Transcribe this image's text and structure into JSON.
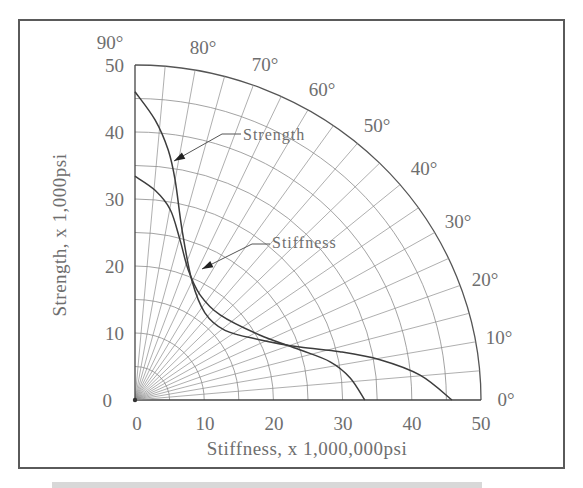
{
  "chart_data": {
    "type": "line",
    "subtype": "polar-quadrant (Hankinson-style) overlay on cartesian axes",
    "title": "",
    "xlabel": "Stiffness, x 1,000,000psi",
    "ylabel": "Strength, x 1,000psi",
    "xlim": [
      0,
      50
    ],
    "ylim": [
      0,
      50
    ],
    "x_ticks": [
      "0",
      "10",
      "20",
      "30",
      "40",
      "50"
    ],
    "y_ticks": [
      "0",
      "10",
      "20",
      "30",
      "40",
      "50"
    ],
    "angle_ticks": [
      "0°",
      "10°",
      "20°",
      "30°",
      "40°",
      "50°",
      "60°",
      "70°",
      "80°",
      "90°"
    ],
    "grid": {
      "radial_lines_every_deg": 5,
      "arcs_every_units": 5,
      "outer_radius": 50
    },
    "legend": null,
    "annotations": [
      {
        "text": "Strength",
        "points_to_series": "Strength"
      },
      {
        "text": "Stiffness",
        "points_to_series": "Stiffness"
      }
    ],
    "series": [
      {
        "name": "Strength",
        "points": [
          [
            0,
            46
          ],
          [
            2.9,
            41.8
          ],
          [
            4.8,
            37.3
          ],
          [
            5.8,
            32.8
          ],
          [
            6.8,
            25.4
          ],
          [
            8.2,
            17.9
          ],
          [
            10.1,
            13
          ],
          [
            13,
            10.4
          ],
          [
            18,
            9
          ],
          [
            23.8,
            7.9
          ],
          [
            29.6,
            7.2
          ],
          [
            35.4,
            6
          ],
          [
            41.2,
            3.7
          ],
          [
            45.8,
            0
          ]
        ]
      },
      {
        "name": "Stiffness",
        "points": [
          [
            0,
            33.4
          ],
          [
            2.9,
            31.3
          ],
          [
            5.1,
            28.4
          ],
          [
            6.5,
            23.9
          ],
          [
            7.7,
            19.4
          ],
          [
            9.4,
            15.7
          ],
          [
            12.3,
            12.7
          ],
          [
            18,
            9.7
          ],
          [
            23.8,
            7.5
          ],
          [
            28.2,
            5.7
          ],
          [
            31.1,
            3.3
          ],
          [
            33.2,
            0
          ]
        ]
      }
    ]
  },
  "labels": {
    "xlabel": "Stiffness, x 1,000,000psi",
    "ylabel": "Strength, x 1,000psi",
    "x_ticks": [
      "0",
      "10",
      "20",
      "30",
      "40",
      "50"
    ],
    "y_ticks": [
      "0",
      "10",
      "20",
      "30",
      "40",
      "50"
    ],
    "angles": [
      "0°",
      "10°",
      "20°",
      "30°",
      "40°",
      "50°",
      "60°",
      "70°",
      "80°",
      "90°"
    ],
    "strength": "Strength",
    "stiffness": "Stiffness"
  },
  "colors": {
    "frame": "#5a5a5a",
    "grid": "#8c8c8c",
    "curve": "#3c3c3c",
    "text": "#6e6e6e"
  }
}
